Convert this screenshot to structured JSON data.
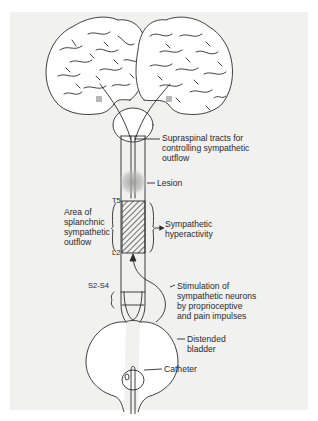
{
  "figure": {
    "background_color": "#f1f1f0",
    "line_color": "#2b2b2b",
    "lesion_color": "#a8a8a8",
    "labels": {
      "supraspinal": "Supraspinal tracts for\ncontrolling sympathetic\noutflow",
      "lesion": "Lesion",
      "area": "Area of\nsplanchnic\nsympathetic\noutflow",
      "t5": "T5",
      "l2": "L2",
      "hyperactivity": "Sympathetic\nhyperactivity",
      "s2s4": "S2-S4",
      "stimulation": "Stimulation of\nsympathetic neurons\nby proprioceptive\nand pain impulses",
      "bladder": "Distended\nbladder",
      "catheter": "Catheter"
    }
  }
}
